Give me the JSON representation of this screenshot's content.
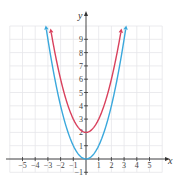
{
  "chart_data": {
    "type": "line",
    "title": "",
    "xlabel": "x",
    "ylabel": "y",
    "xlim": [
      -6,
      6
    ],
    "ylim": [
      -1,
      10
    ],
    "grid": true,
    "legend": null,
    "x_ticks": [
      -5,
      -4,
      -3,
      -2,
      -1,
      1,
      2,
      3,
      4,
      5
    ],
    "y_ticks": [
      -1,
      1,
      2,
      3,
      4,
      5,
      6,
      7,
      8,
      9
    ],
    "series": [
      {
        "name": "y = x^2",
        "color": "#3aa8dc",
        "x": [
          -3.1,
          -3,
          -2,
          -1,
          0,
          1,
          2,
          3,
          3.1
        ],
        "y": [
          9.61,
          9,
          4,
          1,
          0,
          1,
          4,
          9,
          9.61
        ],
        "arrows": true
      },
      {
        "name": "y = x^2 + 2",
        "color": "#d9415d",
        "x": [
          -2.72,
          -2,
          -1,
          0,
          1,
          2,
          2.72
        ],
        "y": [
          9.4,
          6,
          3,
          2,
          3,
          6,
          9.4
        ],
        "arrows": true
      }
    ]
  },
  "axis": {
    "x_label": "x",
    "y_label": "y"
  }
}
